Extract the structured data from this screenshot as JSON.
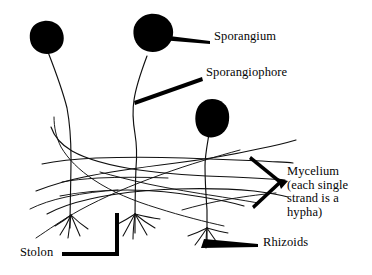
{
  "figure": {
    "background_color": "#ffffff",
    "ink_color": "#000000",
    "width": 372,
    "height": 275
  },
  "labels": {
    "sporangium": "Sporangium",
    "sporangiophore": "Sporangiophore",
    "mycelium_line1": "Mycelium",
    "mycelium_line2": "(each single",
    "mycelium_line3": "strand is a",
    "mycelium_line4": "hypha)",
    "stolon": "Stolon",
    "rhizoids": "Rhizoids"
  },
  "parts": [
    {
      "name": "sporangium",
      "label": "Sporangium",
      "description": "dark round spore case at the tip of an upright stalk",
      "count": 3
    },
    {
      "name": "sporangiophore",
      "label": "Sporangiophore",
      "description": "upright hypha bearing the sporangium",
      "count": 3
    },
    {
      "name": "mycelium",
      "label": "Mycelium (each single strand is a hypha)",
      "description": "network of crossing hyphal strands",
      "count": 1
    },
    {
      "name": "stolon",
      "label": "Stolon",
      "description": "horizontal runner hypha connecting nodes",
      "count": 1
    },
    {
      "name": "rhizoids",
      "label": "Rhizoids",
      "description": "root-like anchoring tufts at the nodes",
      "count": 3
    }
  ]
}
